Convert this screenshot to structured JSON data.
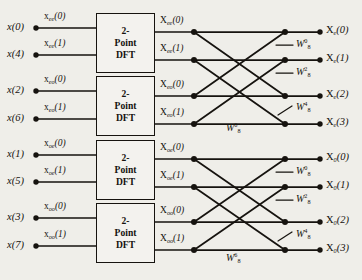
{
  "diagram": {
    "stage_count": 3,
    "line_color": "#16130f",
    "background": "#efeee9",
    "block_fill": "#f3f2ee"
  },
  "inputs": [
    {
      "label": "x(4)",
      "var": "x",
      "index": "4",
      "y": 55
    },
    {
      "label": "x(0)",
      "var": "x",
      "index": "0",
      "y": 28
    },
    {
      "label": "x(2)",
      "var": "x",
      "index": "2",
      "y": 91
    },
    {
      "label": "x(6)",
      "var": "x",
      "index": "6",
      "y": 119
    },
    {
      "label": "x(1)",
      "var": "x",
      "index": "1",
      "y": 155
    },
    {
      "label": "x(5)",
      "var": "x",
      "index": "5",
      "y": 182
    },
    {
      "label": "x(3)",
      "var": "x",
      "index": "3",
      "y": 218
    },
    {
      "label": "x(7)",
      "var": "x",
      "index": "7",
      "y": 246
    }
  ],
  "input_order": [
    "x(0)",
    "x(4)",
    "x(2)",
    "x(6)",
    "x(1)",
    "x(5)",
    "x(3)",
    "x(7)"
  ],
  "dft_blocks": [
    {
      "line1": "2-",
      "line2": "Point",
      "line3": "DFT",
      "subscript": "ee"
    },
    {
      "line1": "2-",
      "line2": "Point",
      "line3": "DFT",
      "subscript": "eo"
    },
    {
      "line1": "2-",
      "line2": "Point",
      "line3": "DFT",
      "subscript": "oe"
    },
    {
      "line1": "2-",
      "line2": "Point",
      "line3": "DFT",
      "subscript": "oo"
    }
  ],
  "block_input_labels": [
    {
      "var": "x",
      "sub": "ee",
      "arg": "(0)"
    },
    {
      "var": "x",
      "sub": "ee",
      "arg": "(1)"
    },
    {
      "var": "x",
      "sub": "eo",
      "arg": "(0)"
    },
    {
      "var": "x",
      "sub": "eo",
      "arg": "(1)"
    },
    {
      "var": "x",
      "sub": "oe",
      "arg": "(0)"
    },
    {
      "var": "x",
      "sub": "oe",
      "arg": "(1)"
    },
    {
      "var": "x",
      "sub": "oo",
      "arg": "(0)"
    },
    {
      "var": "x",
      "sub": "oo",
      "arg": "(1)"
    }
  ],
  "block_output_labels": [
    {
      "var": "X",
      "sub": "ee",
      "arg": "(0)"
    },
    {
      "var": "X",
      "sub": "ee",
      "arg": "(1)"
    },
    {
      "var": "X",
      "sub": "eo",
      "arg": "(0)"
    },
    {
      "var": "X",
      "sub": "eo",
      "arg": "(1)"
    },
    {
      "var": "X",
      "sub": "oe",
      "arg": "(0)"
    },
    {
      "var": "X",
      "sub": "oe",
      "arg": "(1)"
    },
    {
      "var": "X",
      "sub": "oo",
      "arg": "(0)"
    },
    {
      "var": "X",
      "sub": "oo",
      "arg": "(1)"
    }
  ],
  "outputs": [
    {
      "var": "X",
      "sub": "e",
      "arg": "(0)",
      "y": 32
    },
    {
      "var": "X",
      "sub": "e",
      "arg": "(1)",
      "y": 60
    },
    {
      "var": "X",
      "sub": "e",
      "arg": "(2)",
      "y": 96
    },
    {
      "var": "X",
      "sub": "e",
      "arg": "(3)",
      "y": 124
    },
    {
      "var": "X",
      "sub": "0",
      "arg": "(0)",
      "y": 159
    },
    {
      "var": "X",
      "sub": "0",
      "arg": "(1)",
      "y": 187
    },
    {
      "var": "X",
      "sub": "0",
      "arg": "(2)",
      "y": 222
    },
    {
      "var": "X",
      "sub": "0",
      "arg": "(3)",
      "y": 250
    }
  ],
  "output_order": [
    "Xe(0)",
    "Xe(1)",
    "Xe(2)",
    "Xe(3)",
    "X0(0)",
    "X0(1)",
    "X0(2)",
    "X0(3)"
  ],
  "twiddle_factors": [
    {
      "base": "W",
      "sub": "8",
      "sup": "0",
      "x": 298,
      "y": 44
    },
    {
      "base": "W",
      "sub": "8",
      "sup": "2",
      "x": 298,
      "y": 72
    },
    {
      "base": "W",
      "sub": "8",
      "sup": "4",
      "x": 298,
      "y": 108
    },
    {
      "base": "W",
      "sub": "8",
      "sup": "6",
      "x": 228,
      "y": 128
    },
    {
      "base": "W",
      "sub": "8",
      "sup": "0",
      "x": 298,
      "y": 171
    },
    {
      "base": "W",
      "sub": "8",
      "sup": "2",
      "x": 298,
      "y": 199
    },
    {
      "base": "W",
      "sub": "8",
      "sup": "4",
      "x": 298,
      "y": 234
    },
    {
      "base": "W",
      "sub": "8",
      "sup": "6",
      "x": 228,
      "y": 258
    }
  ],
  "twiddle_exponents": [
    "0",
    "2",
    "4",
    "6",
    "0",
    "2",
    "4",
    "6"
  ],
  "twiddle_base_text": "W",
  "twiddle_modulus": "8"
}
